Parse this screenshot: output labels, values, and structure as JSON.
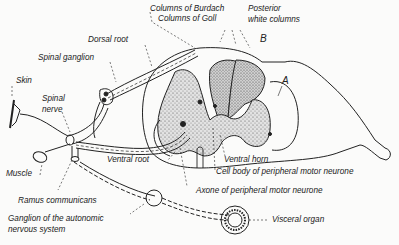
{
  "diagram": {
    "colors": {
      "ink": "#222222",
      "background": "#fbfbfa",
      "stipple": "#9a9a9a"
    },
    "labels": {
      "columns_burdach": "Columns of Burdach",
      "columns_goll": "Columns of Goll",
      "posterior_white_columns_1": "Posterior",
      "posterior_white_columns_2": "white columns",
      "dorsal_root": "Dorsal root",
      "spinal_ganglion": "Spinal ganglion",
      "skin": "Skin",
      "spinal_nerve_1": "Spinal",
      "spinal_nerve_2": "nerve",
      "muscle": "Muscle",
      "ventral_root": "Ventral root",
      "ventral_horn": "Ventral horn",
      "cell_body": "Cell body of peripheral motor neurone",
      "axone": "Axone of peripheral motor neurone",
      "ramus_communicans": "Ramus communicans",
      "ganglion_autonomic_1": "Ganglion of the autonomic",
      "ganglion_autonomic_2": "nervous system",
      "visceral_organ": "Visceral organ",
      "marker_a": "A",
      "marker_b": "B"
    }
  }
}
